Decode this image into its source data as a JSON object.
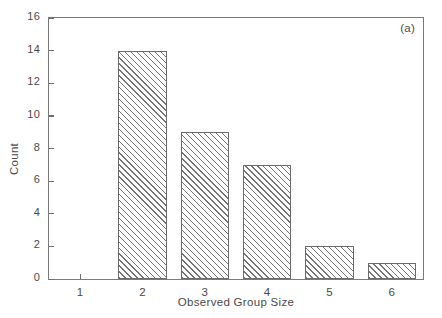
{
  "figure": {
    "panel_label": "(a)",
    "background_color": "#ffffff",
    "frame_color": "#7a7a7a",
    "bar_edge_color": "#6b6b6b",
    "hatch_color": "#737373",
    "text_color": "#4a4a4a"
  },
  "chart_data": {
    "type": "bar",
    "title": "",
    "xlabel": "Observed Group Size",
    "ylabel": "Count",
    "categories": [
      "1",
      "2",
      "3",
      "4",
      "5",
      "6"
    ],
    "values": [
      0,
      14,
      9,
      7,
      2,
      1
    ],
    "ylim": [
      0,
      16
    ],
    "ytick_labels": [
      "0",
      "2",
      "4",
      "6",
      "8",
      "10",
      "12",
      "14",
      "16"
    ],
    "ytick_values": [
      0,
      2,
      4,
      6,
      8,
      10,
      12,
      14,
      16
    ],
    "xtick_labels": [
      "1",
      "2",
      "3",
      "4",
      "5",
      "6"
    ],
    "grid": false,
    "legend": false,
    "legend_position": "none",
    "annotations": [
      {
        "text": "(a)",
        "position": "top-right"
      }
    ],
    "bar_style": "diagonal-hatch",
    "bar_width_fraction": 0.78
  }
}
